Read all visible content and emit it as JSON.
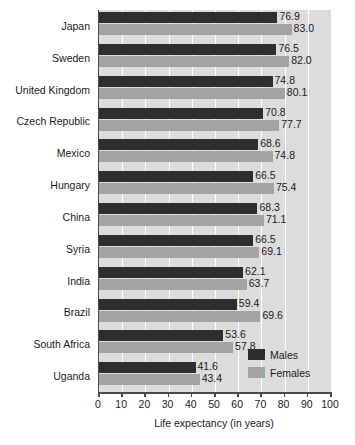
{
  "chart_data": {
    "type": "bar",
    "orientation": "horizontal",
    "title": "",
    "xlabel": "Life expectancy (in years)",
    "ylabel": "",
    "xlim": [
      0,
      100
    ],
    "xticks": [
      0,
      10,
      20,
      30,
      40,
      50,
      60,
      70,
      80,
      90,
      100
    ],
    "grid": true,
    "grid_axis": "x",
    "legend_position": "lower-right",
    "categories": [
      "Japan",
      "Sweden",
      "United Kingdom",
      "Czech Republic",
      "Mexico",
      "Hungary",
      "China",
      "Syria",
      "India",
      "Brazil",
      "South Africa",
      "Uganda"
    ],
    "series": [
      {
        "name": "Males",
        "color": "#2e2e2e",
        "values": [
          76.9,
          76.5,
          74.8,
          70.8,
          68.6,
          66.5,
          68.3,
          66.5,
          62.1,
          59.4,
          53.6,
          41.6
        ]
      },
      {
        "name": "Females",
        "color": "#a3a3a3",
        "values": [
          83.0,
          82.0,
          80.1,
          77.7,
          74.8,
          75.4,
          71.1,
          69.1,
          63.7,
          69.6,
          57.8,
          43.4
        ]
      }
    ],
    "data_labels": [
      {
        "category": "Japan",
        "males": "76.9",
        "females": "83.0"
      },
      {
        "category": "Sweden",
        "males": "76.5",
        "females": "82.0"
      },
      {
        "category": "United Kingdom",
        "males": "74.8",
        "females": "80.1"
      },
      {
        "category": "Czech Republic",
        "males": "70.8",
        "females": "77.7"
      },
      {
        "category": "Mexico",
        "males": "68.6",
        "females": "74.8"
      },
      {
        "category": "Hungary",
        "males": "66.5",
        "females": "75.4"
      },
      {
        "category": "China",
        "males": "68.3",
        "females": "71.1"
      },
      {
        "category": "Syria",
        "males": "66.5",
        "females": "69.1"
      },
      {
        "category": "India",
        "males": "62.1",
        "females": "63.7"
      },
      {
        "category": "Brazil",
        "males": "59.4",
        "females": "69.6"
      },
      {
        "category": "South Africa",
        "males": "53.6",
        "females": "57.8"
      },
      {
        "category": "Uganda",
        "males": "41.6",
        "females": "43.4"
      }
    ]
  },
  "legend": {
    "items": [
      {
        "label": "Males",
        "color": "#2e2e2e"
      },
      {
        "label": "Females",
        "color": "#a3a3a3"
      }
    ]
  },
  "axis": {
    "x_title": "Life expectancy (in years)",
    "tick_labels": [
      "0",
      "10",
      "20",
      "30",
      "40",
      "50",
      "60",
      "70",
      "80",
      "90",
      "100"
    ]
  },
  "colors": {
    "plot_background": "#dcdcdc",
    "gridline": "#ffffff",
    "axis": "#4a4a4a",
    "males_bar": "#2e2e2e",
    "females_bar": "#a3a3a3",
    "text": "#1a1a1a",
    "page_background": "#ffffff"
  }
}
